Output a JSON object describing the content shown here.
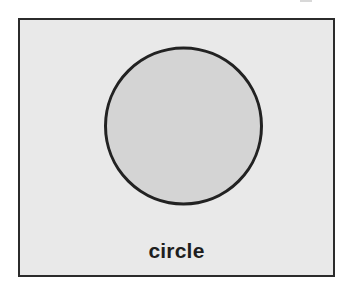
{
  "diagram": {
    "shape": {
      "type": "circle",
      "icon": "circle-icon",
      "fill": "#d4d4d4",
      "stroke": "#222222",
      "stroke_width": 3
    },
    "label": "circle",
    "colors": {
      "frame_background": "#e9e9e9",
      "frame_border": "#2b2b2b",
      "label_color": "#1e1e1e"
    }
  }
}
